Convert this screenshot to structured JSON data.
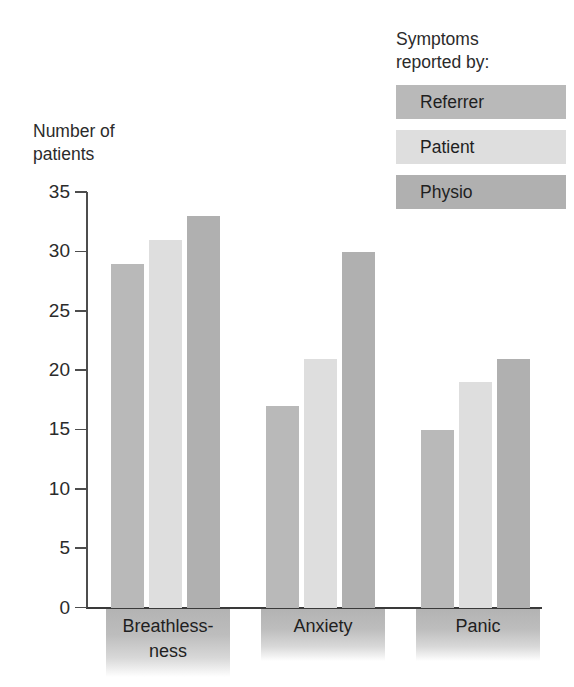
{
  "chart_data": {
    "type": "bar",
    "title": "",
    "subtitle": "",
    "xlabel": "",
    "ylabel": "Number of\npatients",
    "categories": [
      "Breathless-\nness",
      "Anxiety",
      "Panic"
    ],
    "category_plain": [
      "Breathlessness",
      "Anxiety",
      "Panic"
    ],
    "series": [
      {
        "name": "Referrer",
        "values": [
          29,
          17,
          15
        ],
        "color": "#b9b9b9"
      },
      {
        "name": "Patient",
        "values": [
          31,
          21,
          19
        ],
        "color": "#dedede"
      },
      {
        "name": "Physio",
        "values": [
          33,
          30,
          21
        ],
        "color": "#b0b0b0"
      }
    ],
    "ylim": [
      0,
      35
    ],
    "yticks": [
      0,
      5,
      10,
      15,
      20,
      25,
      30,
      35
    ],
    "ytick_labels": [
      "0",
      "5",
      "10",
      "15",
      "20",
      "25",
      "30",
      "35"
    ],
    "grid": false,
    "legend_position": "top-right"
  },
  "legend": {
    "title": "Symptoms\nreported by:",
    "entries": [
      {
        "label": "Referrer",
        "color": "#b9b9b9"
      },
      {
        "label": "Patient",
        "color": "#dedede"
      },
      {
        "label": "Physio",
        "color": "#b0b0b0"
      }
    ]
  },
  "axis": {
    "y_title": "Number of\npatients"
  }
}
